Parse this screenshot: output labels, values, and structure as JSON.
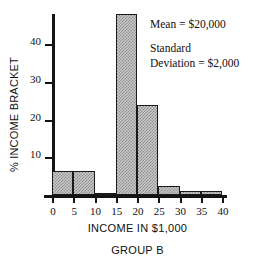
{
  "chart_data": {
    "type": "bar",
    "title": "",
    "subtitle": "GROUP B",
    "xlabel": "INCOME IN $1,000",
    "ylabel": "% INCOME BRACKET",
    "xlim": [
      0,
      40
    ],
    "ylim": [
      0,
      48
    ],
    "grid": false,
    "legend": null,
    "bin_width": 5,
    "x_ticks": [
      "0",
      "5",
      "10",
      "15",
      "20",
      "25",
      "30",
      "35",
      "40"
    ],
    "y_ticks": [
      "10",
      "20",
      "30",
      "40"
    ],
    "bins": [
      {
        "range": "0-5",
        "x0": 0,
        "x1": 5,
        "value": 6.3
      },
      {
        "range": "5-10",
        "x0": 5,
        "x1": 10,
        "value": 6.3
      },
      {
        "range": "10-15",
        "x0": 10,
        "x1": 15,
        "value": 0.5
      },
      {
        "range": "15-20",
        "x0": 15,
        "x1": 20,
        "value": 48
      },
      {
        "range": "20-25",
        "x0": 20,
        "x1": 25,
        "value": 24
      },
      {
        "range": "25-30",
        "x0": 25,
        "x1": 30,
        "value": 2.5
      },
      {
        "range": "30-35",
        "x0": 30,
        "x1": 35,
        "value": 1
      },
      {
        "range": "35-40",
        "x0": 35,
        "x1": 40,
        "value": 1
      }
    ],
    "categories": [
      "0-5",
      "5-10",
      "10-15",
      "15-20",
      "20-25",
      "25-30",
      "30-35",
      "35-40"
    ],
    "values": [
      6.3,
      6.3,
      0.5,
      48,
      24,
      2.5,
      1,
      1
    ],
    "annotations": [
      {
        "id": "mean",
        "text": "Mean  =  $20,000"
      },
      {
        "id": "std-line-1",
        "text": "Standard"
      },
      {
        "id": "std-line-2",
        "text": "Deviation  =  $2,000"
      }
    ],
    "colors": {
      "bar_fill": "#c9c9c9",
      "bar_hatch": "#8e8e8e",
      "bar_border": "#1a1a1a",
      "axis": "#141414",
      "text": "#111111",
      "background": "#ffffff"
    }
  }
}
